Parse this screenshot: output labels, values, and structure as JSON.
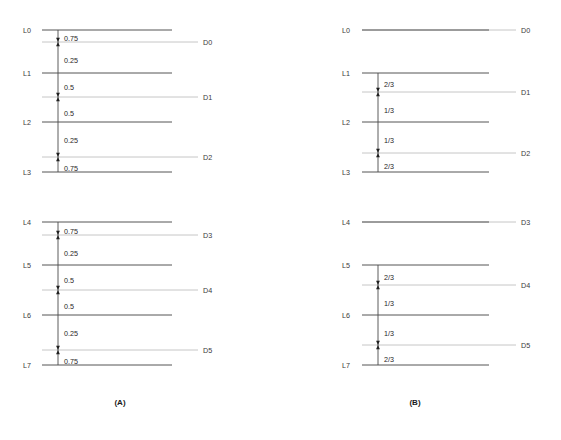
{
  "figure": {
    "background_color": "#ffffff",
    "l_line_color": "#555555",
    "d_line_color": "#c6c6c6",
    "connector_color": "#4a4a4a",
    "arrow_color": "#1f1f1f",
    "text_color": "#333333"
  },
  "panels": [
    {
      "id": "panel-a",
      "caption": "(A)",
      "caption_x": 120,
      "caption_y": 405,
      "l_line_x1": 42,
      "l_line_x2": 172,
      "d_line_x1": 42,
      "d_line_x2": 198,
      "node_label_x": 31,
      "d_label_x": 203,
      "connector_x": 58,
      "weight_label_x": 64,
      "l_nodes": [
        {
          "label": "L0",
          "y": 30
        },
        {
          "label": "L1",
          "y": 73
        },
        {
          "label": "L2",
          "y": 122
        },
        {
          "label": "L3",
          "y": 172
        },
        {
          "label": "L4",
          "y": 222
        },
        {
          "label": "L5",
          "y": 265
        },
        {
          "label": "L6",
          "y": 315
        },
        {
          "label": "L7",
          "y": 365
        }
      ],
      "d_nodes": [
        {
          "label": "D0",
          "y": 42
        },
        {
          "label": "D1",
          "y": 97
        },
        {
          "label": "D2",
          "y": 157
        },
        {
          "label": "D3",
          "y": 235
        },
        {
          "label": "D4",
          "y": 290
        },
        {
          "label": "D5",
          "y": 350
        }
      ],
      "edges": [
        {
          "from": "L0",
          "to": "D0",
          "weight": "0.75",
          "y_from": 30,
          "y_to": 42,
          "label_y": 38
        },
        {
          "from": "L1",
          "to": "D0",
          "weight": "0.25",
          "y_from": 73,
          "y_to": 42,
          "label_y": 60
        },
        {
          "from": "L1",
          "to": "D1",
          "weight": "0.5",
          "y_from": 73,
          "y_to": 97,
          "label_y": 87
        },
        {
          "from": "L2",
          "to": "D1",
          "weight": "0.5",
          "y_from": 122,
          "y_to": 97,
          "label_y": 113
        },
        {
          "from": "L2",
          "to": "D2",
          "weight": "0.25",
          "y_from": 122,
          "y_to": 157,
          "label_y": 140
        },
        {
          "from": "L3",
          "to": "D2",
          "weight": "0.75",
          "y_from": 172,
          "y_to": 157,
          "label_y": 168
        },
        {
          "from": "L4",
          "to": "D3",
          "weight": "0.75",
          "y_from": 222,
          "y_to": 235,
          "label_y": 231
        },
        {
          "from": "L5",
          "to": "D3",
          "weight": "0.25",
          "y_from": 265,
          "y_to": 235,
          "label_y": 253
        },
        {
          "from": "L5",
          "to": "D4",
          "weight": "0.5",
          "y_from": 265,
          "y_to": 290,
          "label_y": 280
        },
        {
          "from": "L6",
          "to": "D4",
          "weight": "0.5",
          "y_from": 315,
          "y_to": 290,
          "label_y": 306
        },
        {
          "from": "L6",
          "to": "D5",
          "weight": "0.25",
          "y_from": 315,
          "y_to": 350,
          "label_y": 333
        },
        {
          "from": "L7",
          "to": "D5",
          "weight": "0.75",
          "y_from": 365,
          "y_to": 350,
          "label_y": 361
        }
      ]
    },
    {
      "id": "panel-b",
      "caption": "(B)",
      "caption_x": 415,
      "caption_y": 405,
      "l_line_x1": 362,
      "l_line_x2": 489,
      "d_line_x1": 362,
      "d_line_x2": 516,
      "node_label_x": 350,
      "d_label_x": 521,
      "connector_x": 378,
      "weight_label_x": 384,
      "l_nodes": [
        {
          "label": "L0",
          "y": 30
        },
        {
          "label": "L1",
          "y": 73
        },
        {
          "label": "L2",
          "y": 122
        },
        {
          "label": "L3",
          "y": 172
        },
        {
          "label": "L4",
          "y": 222
        },
        {
          "label": "L5",
          "y": 265
        },
        {
          "label": "L6",
          "y": 315
        },
        {
          "label": "L7",
          "y": 365
        }
      ],
      "d_nodes": [
        {
          "label": "D0",
          "y": 30
        },
        {
          "label": "D1",
          "y": 92
        },
        {
          "label": "D2",
          "y": 153
        },
        {
          "label": "D3",
          "y": 222
        },
        {
          "label": "D4",
          "y": 285
        },
        {
          "label": "D5",
          "y": 345
        }
      ],
      "edges": [
        {
          "from": "L1",
          "to": "D1",
          "weight": "2/3",
          "y_from": 73,
          "y_to": 92,
          "label_y": 84
        },
        {
          "from": "L2",
          "to": "D1",
          "weight": "1/3",
          "y_from": 122,
          "y_to": 92,
          "label_y": 110
        },
        {
          "from": "L2",
          "to": "D2",
          "weight": "1/3",
          "y_from": 122,
          "y_to": 153,
          "label_y": 140
        },
        {
          "from": "L3",
          "to": "D2",
          "weight": "2/3",
          "y_from": 172,
          "y_to": 153,
          "label_y": 166
        },
        {
          "from": "L5",
          "to": "D4",
          "weight": "2/3",
          "y_from": 265,
          "y_to": 285,
          "label_y": 277
        },
        {
          "from": "L6",
          "to": "D4",
          "weight": "1/3",
          "y_from": 315,
          "y_to": 285,
          "label_y": 303
        },
        {
          "from": "L6",
          "to": "D5",
          "weight": "1/3",
          "y_from": 315,
          "y_to": 345,
          "label_y": 333
        },
        {
          "from": "L7",
          "to": "D5",
          "weight": "2/3",
          "y_from": 365,
          "y_to": 345,
          "label_y": 359
        }
      ]
    }
  ],
  "footer": {
    "caption": "",
    "caption_x": 280,
    "caption_y": 428
  }
}
